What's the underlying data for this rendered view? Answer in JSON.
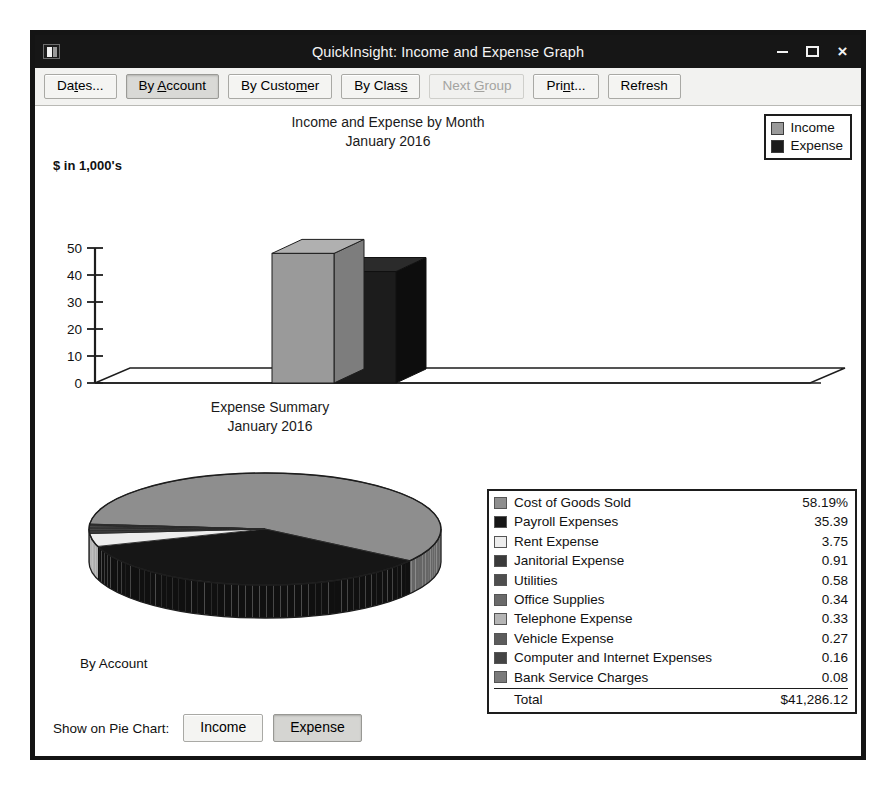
{
  "window": {
    "title": "QuickInsight: Income and Expense Graph",
    "icon": "app-window-icon",
    "controls": {
      "minimize": "–",
      "maximize": "□",
      "close": "×"
    }
  },
  "toolbar": {
    "buttons": [
      {
        "id": "dates",
        "label": "Dates...",
        "pre": "Da",
        "accel": "t",
        "post": "es...",
        "state": "normal"
      },
      {
        "id": "by-account",
        "label": "By Account",
        "pre": "By ",
        "accel": "A",
        "post": "ccount",
        "state": "selected"
      },
      {
        "id": "by-customer",
        "label": "By Customer",
        "pre": "By Custo",
        "accel": "m",
        "post": "er",
        "state": "normal"
      },
      {
        "id": "by-class",
        "label": "By Class",
        "pre": "By Clas",
        "accel": "s",
        "post": "",
        "state": "normal"
      },
      {
        "id": "next-group",
        "label": "Next Group",
        "pre": "Next ",
        "accel": "G",
        "post": "roup",
        "state": "disabled"
      },
      {
        "id": "print",
        "label": "Print...",
        "pre": "Pri",
        "accel": "n",
        "post": "t...",
        "state": "normal"
      },
      {
        "id": "refresh",
        "label": "Refresh",
        "pre": "Refresh",
        "accel": "",
        "post": "",
        "state": "normal"
      }
    ]
  },
  "bar_chart_legend": [
    {
      "label": "Income",
      "color": "#9a9a9a"
    },
    {
      "label": "Expense",
      "color": "#1c1c1c"
    }
  ],
  "footer": {
    "grouping_label": "By Account",
    "show_on_pie_label": "Show on Pie Chart:",
    "income_button": "Income",
    "expense_button": "Expense",
    "selected_pie_series": "Expense"
  },
  "chart_data": [
    {
      "type": "bar",
      "title": "Income and Expense by Month",
      "subtitle": "January 2016",
      "xlabel": "",
      "ylabel": "$ in 1,000's",
      "categories": [
        "Jan 16"
      ],
      "ticks": [
        0,
        10,
        20,
        30,
        40,
        50
      ],
      "ylim": [
        0,
        50
      ],
      "grid": false,
      "legend_position": "top-right",
      "three_d": true,
      "series": [
        {
          "name": "Income",
          "values": [
            48.0
          ],
          "color": "#9a9a9a"
        },
        {
          "name": "Expense",
          "values": [
            41.29
          ],
          "color": "#1c1c1c"
        }
      ]
    },
    {
      "type": "pie",
      "title": "Expense Summary",
      "subtitle": "January 2016",
      "three_d": true,
      "legend_position": "right",
      "value_unit": "percent",
      "total_label": "Total",
      "total_value": "$41,286.12",
      "slices": [
        {
          "label": "Cost of Goods Sold",
          "value": "58.19%",
          "pct": 58.19,
          "color": "#8e8e8e"
        },
        {
          "label": "Payroll Expenses",
          "value": "35.39",
          "pct": 35.39,
          "color": "#161616"
        },
        {
          "label": "Rent Expense",
          "value": "3.75",
          "pct": 3.75,
          "color": "#ededed"
        },
        {
          "label": "Janitorial Expense",
          "value": "0.91",
          "pct": 0.91,
          "color": "#3a3a3a"
        },
        {
          "label": "Utilities",
          "value": "0.58",
          "pct": 0.58,
          "color": "#4e4e4e"
        },
        {
          "label": "Office Supplies",
          "value": "0.34",
          "pct": 0.34,
          "color": "#6a6a6a"
        },
        {
          "label": "Telephone Expense",
          "value": "0.33",
          "pct": 0.33,
          "color": "#b5b5b5"
        },
        {
          "label": "Vehicle Expense",
          "value": "0.27",
          "pct": 0.27,
          "color": "#5c5c5c"
        },
        {
          "label": "Computer and Internet Expenses",
          "value": "0.16",
          "pct": 0.16,
          "color": "#444444"
        },
        {
          "label": "Bank Service Charges",
          "value": "0.08",
          "pct": 0.08,
          "color": "#7a7a7a"
        }
      ]
    }
  ]
}
